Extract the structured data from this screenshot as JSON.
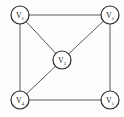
{
  "graph": {
    "type": "undirected",
    "nodes": [
      {
        "id": "v1",
        "label": "V",
        "sub": "1",
        "x": 20,
        "y": 15
      },
      {
        "id": "v2",
        "label": "V",
        "sub": "2",
        "x": 110,
        "y": 15
      },
      {
        "id": "v3",
        "label": "V",
        "sub": "3",
        "x": 62,
        "y": 60
      },
      {
        "id": "v4",
        "label": "V",
        "sub": "4",
        "x": 20,
        "y": 100
      },
      {
        "id": "v5",
        "label": "V",
        "sub": "5",
        "x": 110,
        "y": 100
      }
    ],
    "edges": [
      [
        "v1",
        "v2"
      ],
      [
        "v1",
        "v4"
      ],
      [
        "v1",
        "v3"
      ],
      [
        "v2",
        "v3"
      ],
      [
        "v2",
        "v5"
      ],
      [
        "v3",
        "v4"
      ],
      [
        "v4",
        "v5"
      ]
    ],
    "node_radius": 9,
    "colors": {
      "edge": "#5a5a5a",
      "node_stroke": "#2a2a2a",
      "node_fill": "#ffffff"
    }
  }
}
